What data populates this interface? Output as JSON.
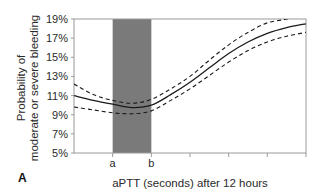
{
  "chart_data": {
    "type": "line",
    "panel_label": "A",
    "title": "",
    "xlabel": "aPTT (seconds) after 12 hours",
    "ylabel_lines": [
      "Probability of",
      "moderate or severe bleeding"
    ],
    "ylim": [
      5,
      19
    ],
    "y_ticks": [
      "5%",
      "7%",
      "9%",
      "11%",
      "13%",
      "15%",
      "17%",
      "19%"
    ],
    "y_tick_values": [
      5,
      7,
      9,
      11,
      13,
      15,
      17,
      19
    ],
    "x_tick_positions": [
      1,
      2,
      3,
      4,
      5,
      6
    ],
    "x_tick_labels": [
      "a",
      "b",
      "",
      "",
      "",
      ""
    ],
    "xlim": [
      0,
      6
    ],
    "shaded_region": {
      "from": 1,
      "to": 2,
      "color": "#7a7a7a",
      "label": "a–b"
    },
    "grid": false,
    "legend": null,
    "x": [
      0,
      0.5,
      1,
      1.5,
      2,
      2.5,
      3,
      3.5,
      4,
      4.5,
      5,
      5.5,
      6
    ],
    "series": [
      {
        "name": "Estimate",
        "style": "solid",
        "values": [
          11.0,
          10.5,
          10.1,
          9.75,
          10.0,
          11.1,
          12.4,
          13.9,
          15.4,
          16.6,
          17.5,
          18.1,
          18.5
        ]
      },
      {
        "name": "Upper confidence limit",
        "style": "dashed",
        "values": [
          12.2,
          11.1,
          10.5,
          10.2,
          10.6,
          11.7,
          13.0,
          14.7,
          16.3,
          17.6,
          18.6,
          19.0,
          null
        ]
      },
      {
        "name": "Lower confidence limit",
        "style": "dashed",
        "values": [
          9.8,
          9.5,
          9.2,
          9.1,
          9.4,
          10.5,
          11.7,
          13.1,
          14.5,
          15.7,
          16.6,
          17.2,
          17.6
        ]
      }
    ]
  },
  "colors": {
    "axis": "#9a9a9a",
    "shade": "#7a7a7a",
    "line": "#1a1a1a"
  }
}
